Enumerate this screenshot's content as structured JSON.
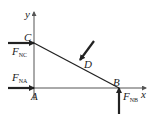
{
  "diagram": {
    "type": "free-body-diagram",
    "axes": {
      "x_label": "x",
      "y_label": "y"
    },
    "points": {
      "A": "A",
      "B": "B",
      "C": "C",
      "D": "D"
    },
    "forces": {
      "FNC": {
        "symbol": "F",
        "subscript": "NC",
        "point": "C",
        "direction": "right"
      },
      "FNA": {
        "symbol": "F",
        "subscript": "NA",
        "point": "A",
        "direction": "right"
      },
      "FNB": {
        "symbol": "F",
        "subscript": "NB",
        "point": "B",
        "direction": "up"
      },
      "load_D": {
        "point": "D",
        "direction": "down-left"
      }
    },
    "colors": {
      "line": "#222222",
      "axis": "#555555"
    }
  }
}
